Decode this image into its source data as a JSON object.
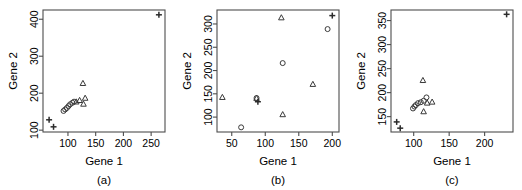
{
  "figure": {
    "panel_count": 3,
    "axis_color": "#4d4d4d",
    "marker_color": "#3a3a3a",
    "background": "#ffffff"
  },
  "panels": [
    {
      "caption": "(a)",
      "xlabel": "Gene 1",
      "ylabel": "Gene 2",
      "xticks": [
        "100",
        "150",
        "200",
        "250"
      ],
      "yticks": [
        "100",
        "200",
        "300",
        "400"
      ]
    },
    {
      "caption": "(b)",
      "xlabel": "Gene 1",
      "ylabel": "Gene 2",
      "xticks": [
        "50",
        "100",
        "150",
        "200"
      ],
      "yticks": [
        "100",
        "150",
        "200",
        "250",
        "300"
      ]
    },
    {
      "caption": "(c)",
      "xlabel": "Gene 1",
      "ylabel": "Gene 2",
      "xticks": [
        "100",
        "150",
        "200"
      ],
      "yticks": [
        "150",
        "200",
        "250",
        "300",
        "350"
      ]
    }
  ],
  "chart_data": [
    {
      "type": "scatter",
      "title": "(a)",
      "xlabel": "Gene 1",
      "ylabel": "Gene 2",
      "xlim": [
        55,
        275
      ],
      "ylim": [
        95,
        425
      ],
      "xticks": [
        100,
        150,
        200,
        250
      ],
      "yticks": [
        100,
        200,
        300,
        400
      ],
      "grid": false,
      "legend": "none",
      "series": [
        {
          "name": "circle",
          "marker": "circle",
          "points": [
            [
              92,
              152
            ],
            [
              95,
              156
            ],
            [
              98,
              160
            ],
            [
              101,
              165
            ],
            [
              104,
              170
            ],
            [
              108,
              174
            ],
            [
              111,
              177
            ]
          ]
        },
        {
          "name": "triangle",
          "marker": "triangle",
          "points": [
            [
              115,
              176
            ],
            [
              121,
              180
            ],
            [
              127,
              226
            ],
            [
              128,
              170
            ],
            [
              131,
              186
            ]
          ]
        },
        {
          "name": "plus",
          "marker": "plus",
          "points": [
            [
              66,
              128
            ],
            [
              74,
              109
            ],
            [
              264,
              412
            ]
          ]
        }
      ]
    },
    {
      "type": "scatter",
      "title": "(b)",
      "xlabel": "Gene 1",
      "ylabel": "Gene 2",
      "xlim": [
        28,
        210
      ],
      "ylim": [
        68,
        330
      ],
      "xticks": [
        50,
        100,
        150,
        200
      ],
      "yticks": [
        100,
        150,
        200,
        250,
        300
      ],
      "grid": false,
      "legend": "none",
      "series": [
        {
          "name": "circle",
          "marker": "circle",
          "points": [
            [
              64,
              78
            ],
            [
              87,
              141
            ],
            [
              126,
              216
            ],
            [
              193,
              289
            ]
          ]
        },
        {
          "name": "triangle",
          "marker": "triangle",
          "points": [
            [
              36,
              142
            ],
            [
              87,
              140
            ],
            [
              126,
              105
            ],
            [
              124,
              313
            ],
            [
              171,
              170
            ]
          ]
        },
        {
          "name": "plus",
          "marker": "plus",
          "points": [
            [
              89,
              133
            ],
            [
              200,
              318
            ]
          ]
        }
      ]
    },
    {
      "type": "scatter",
      "title": "(c)",
      "xlabel": "Gene 1",
      "ylabel": "Gene 2",
      "xlim": [
        68,
        240
      ],
      "ylim": [
        118,
        372
      ],
      "xticks": [
        100,
        150,
        200
      ],
      "yticks": [
        150,
        200,
        250,
        300,
        350
      ],
      "grid": false,
      "legend": "none",
      "series": [
        {
          "name": "circle",
          "marker": "circle",
          "points": [
            [
              99,
              167
            ],
            [
              101,
              171
            ],
            [
              103,
              174
            ],
            [
              106,
              178
            ],
            [
              110,
              180
            ],
            [
              114,
              183
            ],
            [
              118,
              190
            ]
          ]
        },
        {
          "name": "triangle",
          "marker": "triangle",
          "points": [
            [
              113,
              225
            ],
            [
              114,
              160
            ],
            [
              119,
              178
            ],
            [
              126,
              180
            ]
          ]
        },
        {
          "name": "plus",
          "marker": "plus",
          "points": [
            [
              76,
              139
            ],
            [
              81,
              126
            ],
            [
              231,
              363
            ]
          ]
        }
      ]
    }
  ]
}
